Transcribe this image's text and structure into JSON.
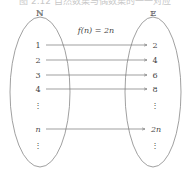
{
  "caption": "图 2.12 自然数集与偶数集的一一对应",
  "diagram": {
    "left_set": {
      "label": "ℕ",
      "elements": [
        "1",
        "2",
        "3",
        "4",
        "⋮",
        "n",
        "⋮"
      ]
    },
    "right_set": {
      "label": "𝔼",
      "elements": [
        "2",
        "4",
        "6",
        "8",
        "⋮",
        "2n",
        "⋮"
      ]
    },
    "mapping_label": "f(n) = 2n",
    "arrows": [
      {
        "from": "1",
        "to": "2"
      },
      {
        "from": "2",
        "to": "4"
      },
      {
        "from": "3",
        "to": "6"
      },
      {
        "from": "4",
        "to": "8"
      },
      {
        "from": "n",
        "to": "2n"
      }
    ],
    "colors": {
      "line": "#777777",
      "text": "#444444"
    }
  }
}
